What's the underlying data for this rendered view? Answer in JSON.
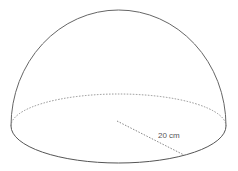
{
  "diagram": {
    "shape": "hemisphere",
    "radius_label": "20 cm",
    "stroke_color": "#666666"
  }
}
